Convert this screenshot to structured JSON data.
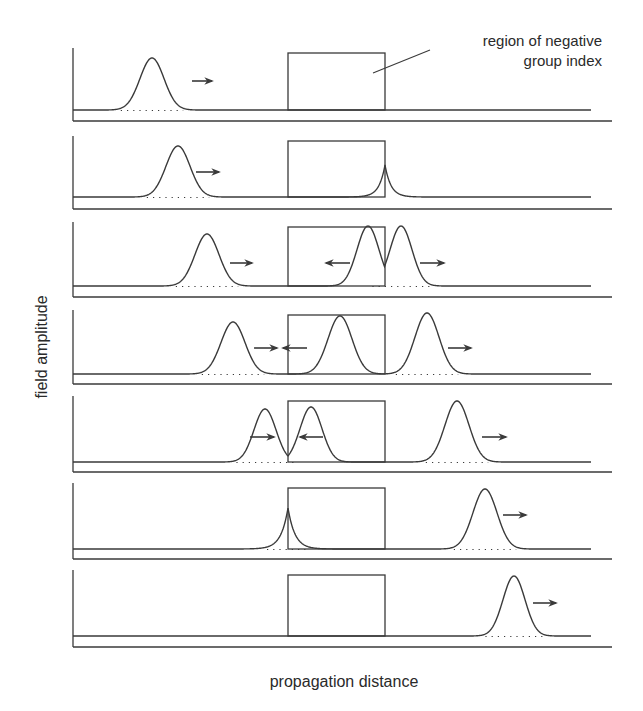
{
  "figure": {
    "annotation": {
      "line1": "region of negative",
      "line2": "group index"
    },
    "y_axis_label": "field amplitude",
    "x_axis_label": "propagation distance",
    "colors": {
      "line": "#3a3a3a",
      "background": "#ffffff"
    },
    "region_box": {
      "x_left": 288,
      "x_right": 385
    },
    "panels": [
      {
        "top": 48,
        "baseline": 110,
        "bottom": 121,
        "pulses": [
          {
            "type": "gauss",
            "center": 152,
            "peak": 58,
            "sigma": 12,
            "dotted": true
          }
        ],
        "arrows": [
          {
            "dir": "right",
            "x1": 192,
            "x2": 212,
            "y": 81
          }
        ]
      },
      {
        "top": 136,
        "baseline": 197,
        "bottom": 209,
        "pulses": [
          {
            "type": "gauss",
            "center": 178,
            "peak": 146,
            "sigma": 12,
            "dotted": true
          },
          {
            "type": "cusp",
            "center": 385,
            "peak": 165,
            "decay": 6
          }
        ],
        "arrows": [
          {
            "dir": "right",
            "x1": 196,
            "x2": 219,
            "y": 172
          }
        ]
      },
      {
        "top": 222,
        "baseline": 286,
        "bottom": 297,
        "pulses": [
          {
            "type": "gauss",
            "center": 207,
            "peak": 234,
            "sigma": 12,
            "dotted": true
          },
          {
            "type": "gauss",
            "center": 368,
            "peak": 226,
            "sigma": 11,
            "dotted": false
          },
          {
            "type": "gauss",
            "center": 401,
            "peak": 226,
            "sigma": 11,
            "dotted": true
          }
        ],
        "arrows": [
          {
            "dir": "right",
            "x1": 230,
            "x2": 252,
            "y": 263
          },
          {
            "dir": "left",
            "x1": 326,
            "x2": 350,
            "y": 263
          },
          {
            "dir": "right",
            "x1": 420,
            "x2": 444,
            "y": 263
          }
        ]
      },
      {
        "top": 310,
        "baseline": 374,
        "bottom": 384,
        "pulses": [
          {
            "type": "gauss",
            "center": 233,
            "peak": 322,
            "sigma": 12,
            "dotted": true
          },
          {
            "type": "gauss",
            "center": 340,
            "peak": 316,
            "sigma": 12,
            "dotted": false
          },
          {
            "type": "gauss",
            "center": 427,
            "peak": 313,
            "sigma": 12,
            "dotted": true
          }
        ],
        "arrows": [
          {
            "dir": "right",
            "x1": 254,
            "x2": 277,
            "y": 348
          },
          {
            "dir": "left",
            "x1": 283,
            "x2": 307,
            "y": 348
          },
          {
            "dir": "right",
            "x1": 448,
            "x2": 471,
            "y": 348
          }
        ]
      },
      {
        "top": 396,
        "baseline": 462,
        "bottom": 472,
        "pulses": [
          {
            "type": "gauss",
            "center": 265,
            "peak": 409,
            "sigma": 11,
            "dotted": true
          },
          {
            "type": "gauss",
            "center": 311,
            "peak": 407,
            "sigma": 11,
            "dotted": false
          },
          {
            "type": "gauss",
            "center": 457,
            "peak": 401,
            "sigma": 12,
            "dotted": true
          }
        ],
        "arrows": [
          {
            "dir": "right",
            "x1": 250,
            "x2": 274,
            "y": 437
          },
          {
            "dir": "left",
            "x1": 300,
            "x2": 323,
            "y": 437
          },
          {
            "dir": "right",
            "x1": 482,
            "x2": 506,
            "y": 437
          }
        ]
      },
      {
        "top": 483,
        "baseline": 549,
        "bottom": 559,
        "pulses": [
          {
            "type": "cusp",
            "center": 288,
            "peak": 508,
            "decay": 7,
            "dotted": true
          },
          {
            "type": "gauss",
            "center": 485,
            "peak": 489,
            "sigma": 12,
            "dotted": true
          }
        ],
        "arrows": [
          {
            "dir": "right",
            "x1": 503,
            "x2": 526,
            "y": 515
          }
        ]
      },
      {
        "top": 570,
        "baseline": 636,
        "bottom": 647,
        "pulses": [
          {
            "type": "gauss",
            "center": 514,
            "peak": 576,
            "sigma": 11,
            "dotted": true
          }
        ],
        "arrows": [
          {
            "dir": "right",
            "x1": 533,
            "x2": 556,
            "y": 603
          }
        ]
      }
    ]
  }
}
